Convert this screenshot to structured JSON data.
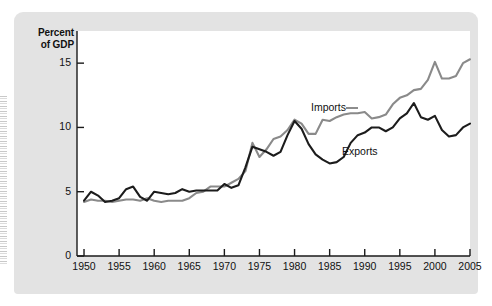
{
  "figure": {
    "background_color": "#e3e3e3",
    "plot_background_color": "#ffffff",
    "axis_color": "#1a1a1a"
  },
  "axis_title": "Percent\nof GDP",
  "axis_title_line1": "Percent",
  "axis_title_line2": "of GDP",
  "labels": {
    "imports": "Imports",
    "exports": "Exports"
  },
  "chart_data": {
    "type": "line",
    "title": "",
    "xlabel": "",
    "ylabel": "Percent of GDP",
    "xlim": [
      1949,
      2005
    ],
    "ylim": [
      0,
      17.5
    ],
    "xticks": [
      1950,
      1955,
      1960,
      1965,
      1970,
      1975,
      1980,
      1985,
      1990,
      1995,
      2000,
      2005
    ],
    "xtick_labels": [
      "1950",
      "1955",
      "1960",
      "1965",
      "1970",
      "1975",
      "1980",
      "1985",
      "1990",
      "1995",
      "2000",
      "2005"
    ],
    "yticks": [
      0,
      5,
      10,
      15
    ],
    "ytick_labels": [
      "0",
      "5",
      "10",
      "15"
    ],
    "grid": false,
    "legend": "inline-annotations",
    "x": [
      1950,
      1951,
      1952,
      1953,
      1954,
      1955,
      1956,
      1957,
      1958,
      1959,
      1960,
      1961,
      1962,
      1963,
      1964,
      1965,
      1966,
      1967,
      1968,
      1969,
      1970,
      1971,
      1972,
      1973,
      1974,
      1975,
      1976,
      1977,
      1978,
      1979,
      1980,
      1981,
      1982,
      1983,
      1984,
      1985,
      1986,
      1987,
      1988,
      1989,
      1990,
      1991,
      1992,
      1993,
      1994,
      1995,
      1996,
      1997,
      1998,
      1999,
      2000,
      2001,
      2002,
      2003,
      2004,
      2005
    ],
    "series": [
      {
        "name": "Imports",
        "color": "#8a8a8a",
        "values": [
          4.2,
          4.4,
          4.3,
          4.3,
          4.2,
          4.3,
          4.4,
          4.4,
          4.3,
          4.5,
          4.3,
          4.2,
          4.3,
          4.3,
          4.3,
          4.5,
          4.9,
          5.0,
          5.4,
          5.4,
          5.4,
          5.7,
          6.0,
          6.6,
          8.8,
          7.7,
          8.3,
          9.1,
          9.3,
          9.8,
          10.6,
          10.3,
          9.5,
          9.5,
          10.6,
          10.5,
          10.8,
          11.0,
          11.1,
          11.1,
          11.2,
          10.7,
          10.8,
          11.0,
          11.8,
          12.3,
          12.5,
          12.9,
          13.0,
          13.7,
          15.1,
          13.8,
          13.8,
          14.0,
          15.0,
          15.3
        ]
      },
      {
        "name": "Exports",
        "color": "#1c1c1c",
        "values": [
          4.3,
          5.0,
          4.7,
          4.2,
          4.3,
          4.5,
          5.2,
          5.4,
          4.6,
          4.3,
          5.0,
          4.9,
          4.8,
          4.9,
          5.2,
          5.0,
          5.1,
          5.1,
          5.1,
          5.1,
          5.6,
          5.3,
          5.5,
          6.9,
          8.5,
          8.3,
          8.1,
          7.8,
          8.1,
          9.4,
          10.5,
          9.9,
          8.7,
          7.9,
          7.5,
          7.2,
          7.3,
          7.7,
          8.8,
          9.4,
          9.6,
          10.0,
          10.0,
          9.7,
          10.0,
          10.7,
          11.1,
          11.9,
          10.8,
          10.6,
          10.9,
          9.8,
          9.3,
          9.4,
          10.0,
          10.3
        ]
      }
    ],
    "annotations": [
      {
        "text": "Imports",
        "x": 1988,
        "y": 12.4
      },
      {
        "text": "Exports",
        "x": 1991,
        "y": 8.1
      }
    ]
  }
}
